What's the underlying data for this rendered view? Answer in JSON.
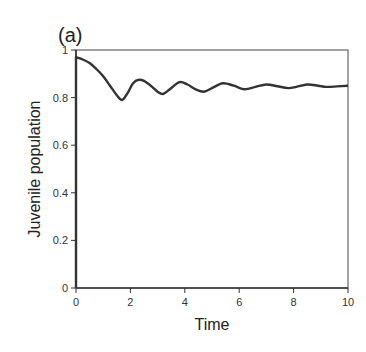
{
  "chart_data": {
    "type": "line",
    "panel_label": "(a)",
    "title": "",
    "xlabel": "Time",
    "ylabel": "Juvenile population",
    "xlim": [
      0,
      10
    ],
    "ylim": [
      0,
      1
    ],
    "xticks": [
      0,
      2,
      4,
      6,
      8,
      10
    ],
    "yticks": [
      0,
      0.2,
      0.4,
      0.6,
      0.8,
      1
    ],
    "xtick_labels": [
      "0",
      "2",
      "4",
      "6",
      "8",
      "10"
    ],
    "ytick_labels": [
      "0",
      "0.2",
      "0.4",
      "0.6",
      "0.8",
      "1"
    ],
    "grid": false,
    "legend": null,
    "series": [
      {
        "name": "Juvenile population",
        "color": "#333333",
        "x": [
          0,
          0,
          0.25,
          0.5,
          0.75,
          1.0,
          1.25,
          1.5,
          1.7,
          1.9,
          2.1,
          2.3,
          2.5,
          2.75,
          3.0,
          3.2,
          3.45,
          3.8,
          4.1,
          4.4,
          4.7,
          5.0,
          5.4,
          5.8,
          6.2,
          6.6,
          7.0,
          7.4,
          7.8,
          8.1,
          8.5,
          8.9,
          9.2,
          9.6,
          10
        ],
        "y": [
          0,
          0.97,
          0.96,
          0.945,
          0.92,
          0.89,
          0.85,
          0.81,
          0.79,
          0.82,
          0.86,
          0.875,
          0.87,
          0.85,
          0.825,
          0.815,
          0.835,
          0.865,
          0.855,
          0.835,
          0.825,
          0.84,
          0.86,
          0.85,
          0.835,
          0.845,
          0.855,
          0.848,
          0.84,
          0.845,
          0.855,
          0.85,
          0.845,
          0.847,
          0.85
        ]
      }
    ]
  }
}
